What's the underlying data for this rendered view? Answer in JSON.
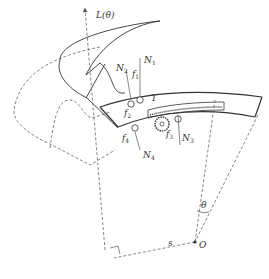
{
  "diagram": {
    "type": "mechanism-schematic",
    "labels": {
      "axis_L": "L(θ)",
      "N1": "N",
      "N1_sub": "1",
      "N2": "N",
      "N2_sub": "2",
      "N3": "N",
      "N3_sub": "3",
      "N4": "N",
      "N4_sub": "4",
      "f1": "f",
      "f1_sub": "1",
      "f2": "f",
      "f2_sub": "2",
      "f3": "f",
      "f3_sub": "3",
      "f4": "f",
      "f4_sub": "4",
      "T": "T",
      "theta": "θ",
      "s": "s",
      "O": "O"
    },
    "colors": {
      "line": "#333333",
      "dashed": "#666666",
      "background": "#ffffff"
    }
  }
}
